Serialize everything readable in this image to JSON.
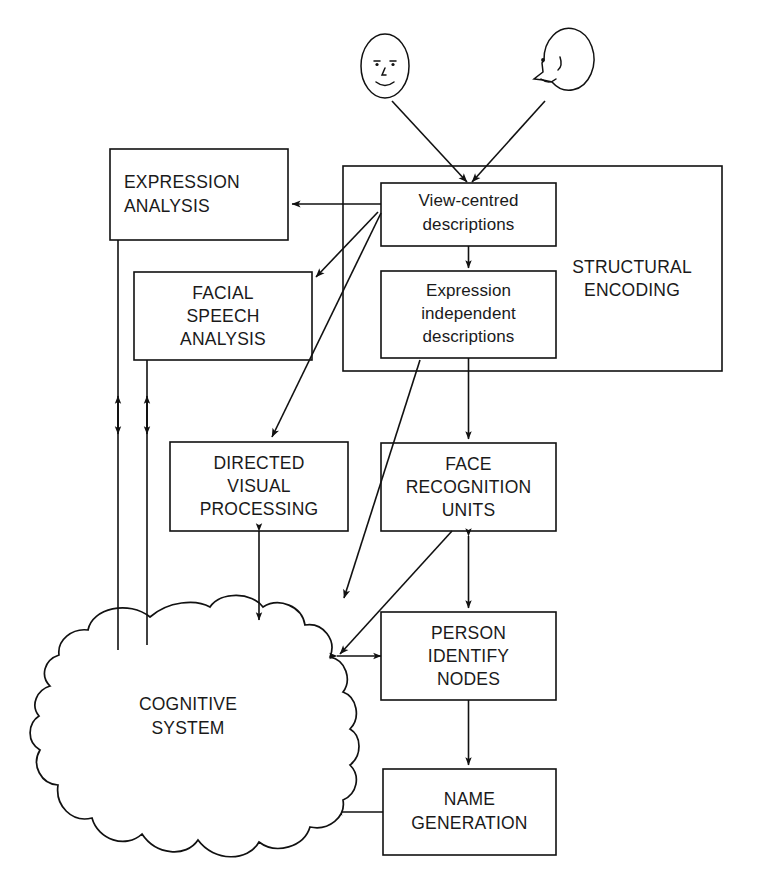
{
  "diagram": {
    "stroke_color": "#111111",
    "background_color": "#ffffff",
    "text_color": "#1a1a1a"
  },
  "faces": [
    {
      "name": "frontal-face",
      "view": "front view",
      "eyes": 2,
      "has_nose": true,
      "has_mouth": true
    },
    {
      "name": "profile-face",
      "view": "profile view",
      "eyes": 1,
      "has_nose": true,
      "has_mouth": true
    }
  ],
  "nodes": {
    "expression_analysis": {
      "label_lines": [
        "EXPRESSION",
        "ANALYSIS"
      ],
      "align": "left"
    },
    "facial_speech_analysis": {
      "label_lines": [
        "FACIAL",
        "SPEECH",
        "ANALYSIS"
      ],
      "align": "center"
    },
    "directed_visual_processing": {
      "label_lines": [
        "DIRECTED",
        "VISUAL",
        "PROCESSING"
      ],
      "align": "center"
    },
    "structural_encoding": {
      "label_lines": [
        "STRUCTURAL",
        "ENCODING"
      ],
      "align": "center"
    },
    "view_centred_descriptions": {
      "label_lines": [
        "View-centred",
        "descriptions"
      ],
      "align": "center"
    },
    "expression_independent_descriptions": {
      "label_lines": [
        "Expression",
        "independent",
        "descriptions"
      ],
      "align": "center"
    },
    "face_recognition_units": {
      "label_lines": [
        "FACE",
        "RECOGNITION",
        "UNITS"
      ],
      "align": "center"
    },
    "person_identify_nodes": {
      "label_lines": [
        "PERSON",
        "IDENTIFY",
        "NODES"
      ],
      "align": "center"
    },
    "name_generation": {
      "label_lines": [
        "NAME",
        "GENERATION"
      ],
      "align": "center"
    },
    "cognitive_system": {
      "label_lines": [
        "COGNITIVE",
        "SYSTEM"
      ],
      "align": "center",
      "shape": "cloud"
    }
  },
  "connections": [
    {
      "from": "frontal-face",
      "to": "view-centred-descriptions",
      "arrow": "single"
    },
    {
      "from": "profile-face",
      "to": "view-centred-descriptions",
      "arrow": "single"
    },
    {
      "from": "view-centred-descriptions",
      "to": "expression-analysis",
      "arrow": "single"
    },
    {
      "from": "view-centred-descriptions",
      "to": "facial-speech-analysis",
      "arrow": "single"
    },
    {
      "from": "view-centred-descriptions",
      "to": "directed-visual-processing",
      "arrow": "single"
    },
    {
      "from": "view-centred-descriptions",
      "to": "expression-independent-descriptions",
      "arrow": "single"
    },
    {
      "from": "expression-independent-descriptions",
      "to": "face-recognition-units",
      "arrow": "single"
    },
    {
      "from": "expression-independent-descriptions",
      "to": "person-identify-nodes",
      "arrow": "single"
    },
    {
      "from": "face-recognition-units",
      "to": "person-identify-nodes",
      "arrow": "double"
    },
    {
      "from": "face-recognition-units",
      "to": "cognitive-system",
      "arrow": "single"
    },
    {
      "from": "person-identify-nodes",
      "to": "name-generation",
      "arrow": "single"
    },
    {
      "from": "name-generation",
      "to": "cognitive-system",
      "arrow": "single"
    },
    {
      "from": "cognitive-system",
      "to": "person-identify-nodes",
      "arrow": "double"
    },
    {
      "from": "cognitive-system",
      "to": "directed-visual-processing",
      "arrow": "double"
    },
    {
      "from": "cognitive-system",
      "to": "expression-analysis",
      "arrow": "double"
    },
    {
      "from": "cognitive-system",
      "to": "facial-speech-analysis",
      "arrow": "double"
    }
  ]
}
